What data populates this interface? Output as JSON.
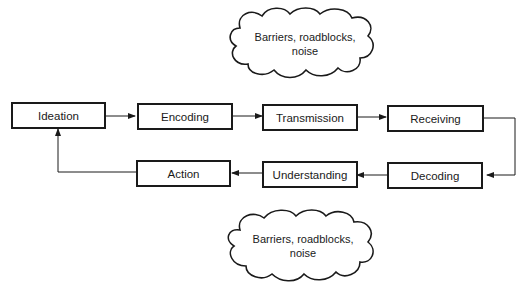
{
  "diagram": {
    "type": "communication process flow",
    "nodes": [
      {
        "id": "ideation",
        "label": "Ideation"
      },
      {
        "id": "encoding",
        "label": "Encoding"
      },
      {
        "id": "transmission",
        "label": "Transmission"
      },
      {
        "id": "receiving",
        "label": "Receiving"
      },
      {
        "id": "decoding",
        "label": "Decoding"
      },
      {
        "id": "understanding",
        "label": "Understanding"
      },
      {
        "id": "action",
        "label": "Action"
      }
    ],
    "edges": [
      [
        "ideation",
        "encoding"
      ],
      [
        "encoding",
        "transmission"
      ],
      [
        "transmission",
        "receiving"
      ],
      [
        "receiving",
        "decoding"
      ],
      [
        "decoding",
        "understanding"
      ],
      [
        "understanding",
        "action"
      ],
      [
        "action",
        "ideation"
      ]
    ],
    "clouds": [
      {
        "id": "top",
        "line1": "Barriers, roadblocks,",
        "line2": "noise"
      },
      {
        "id": "bottom",
        "line1": "Barriers, roadblocks,",
        "line2": "noise"
      }
    ]
  }
}
